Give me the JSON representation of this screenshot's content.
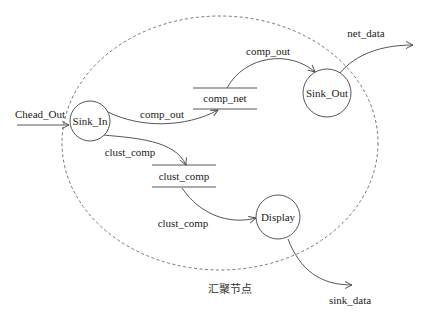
{
  "diagram": {
    "type": "data-flow-diagram",
    "boundary_label": "汇聚节点",
    "processes": [
      {
        "id": "sink_in",
        "label": "Sink_In"
      },
      {
        "id": "sink_out",
        "label": "Sink_Out"
      },
      {
        "id": "display",
        "label": "Display"
      }
    ],
    "data_stores": [
      {
        "id": "comp_net",
        "label": "comp_net"
      },
      {
        "id": "clust_comp",
        "label": "clust_comp"
      }
    ],
    "flows": [
      {
        "from": "external",
        "to": "sink_in",
        "label": "Chead_Out"
      },
      {
        "from": "sink_in",
        "to": "comp_net",
        "label": "comp_out"
      },
      {
        "from": "comp_net",
        "to": "sink_out",
        "label": "comp_out"
      },
      {
        "from": "sink_out",
        "to": "external",
        "label": "net_data"
      },
      {
        "from": "sink_in",
        "to": "clust_comp",
        "label": "clust_comp"
      },
      {
        "from": "clust_comp",
        "to": "display",
        "label": "clust_comp"
      },
      {
        "from": "display",
        "to": "external",
        "label": "sink_data"
      }
    ]
  }
}
